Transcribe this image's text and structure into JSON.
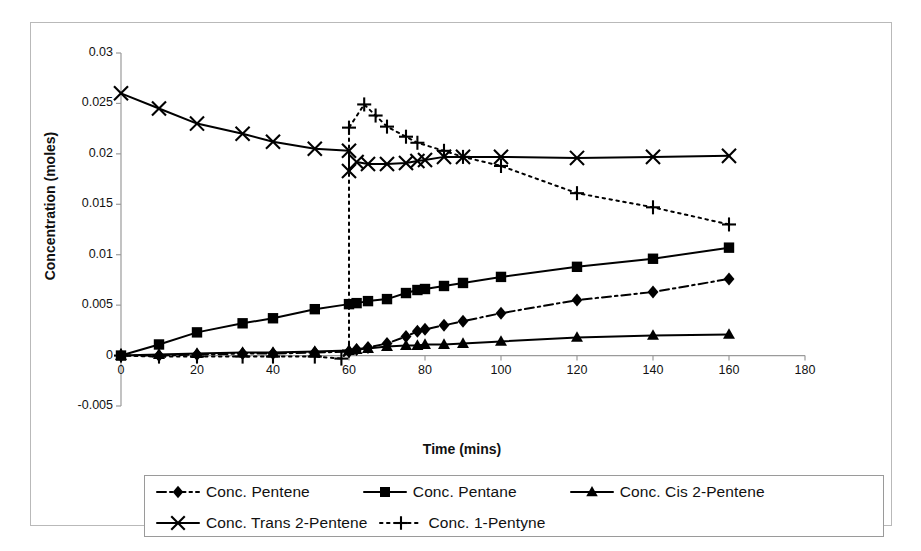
{
  "chart_data": {
    "type": "line",
    "title": "",
    "xlabel": "Time (mins)",
    "ylabel": "Concentration (moles)",
    "xlim": [
      0,
      180
    ],
    "ylim": [
      -0.005,
      0.03
    ],
    "xticks": [
      0,
      20,
      40,
      60,
      80,
      100,
      120,
      140,
      160,
      180
    ],
    "xtick_labels": [
      "0",
      "20",
      "40",
      "60",
      "80",
      "100",
      "120",
      "140",
      "160",
      "180"
    ],
    "yticks": [
      -0.005,
      0,
      0.005,
      0.01,
      0.015,
      0.02,
      0.025,
      0.03
    ],
    "ytick_labels": [
      "-0.005",
      "0",
      "0.005",
      "0.01",
      "0.015",
      "0.02",
      "0.025",
      "0.03"
    ],
    "grid": false,
    "legend_position": "bottom",
    "series": [
      {
        "name": "Conc. Pentene",
        "marker": "diamond",
        "line_style": "dash-dot",
        "color": "#000000",
        "x": [
          0,
          10,
          20,
          32,
          40,
          51,
          60,
          62,
          65,
          70,
          75,
          78,
          80,
          85,
          90,
          100,
          120,
          140,
          160
        ],
        "y": [
          0.0,
          0.0,
          0.0001,
          0.0002,
          0.0002,
          0.0003,
          0.0004,
          0.0006,
          0.0008,
          0.0012,
          0.0019,
          0.0024,
          0.0026,
          0.003,
          0.0034,
          0.0042,
          0.0055,
          0.0063,
          0.0076
        ]
      },
      {
        "name": "Conc. Pentane",
        "marker": "square",
        "line_style": "solid",
        "color": "#000000",
        "x": [
          0,
          10,
          20,
          32,
          40,
          51,
          60,
          62,
          65,
          70,
          75,
          78,
          80,
          85,
          90,
          100,
          120,
          140,
          160
        ],
        "y": [
          0.0,
          0.0011,
          0.0023,
          0.0032,
          0.0037,
          0.0046,
          0.0051,
          0.0052,
          0.0054,
          0.0056,
          0.0062,
          0.0065,
          0.0066,
          0.0069,
          0.0072,
          0.0078,
          0.0088,
          0.0096,
          0.0107
        ]
      },
      {
        "name": "Conc. Cis 2-Pentene",
        "marker": "triangle",
        "line_style": "solid",
        "color": "#000000",
        "x": [
          0,
          10,
          20,
          32,
          40,
          51,
          60,
          62,
          65,
          70,
          75,
          78,
          80,
          85,
          90,
          100,
          120,
          140,
          160
        ],
        "y": [
          0.0,
          0.0001,
          0.0002,
          0.0003,
          0.0003,
          0.0004,
          0.0005,
          0.0006,
          0.0007,
          0.0009,
          0.001,
          0.001,
          0.0011,
          0.0011,
          0.0012,
          0.0014,
          0.0018,
          0.002,
          0.0021
        ]
      },
      {
        "name": "Conc. Trans 2-Pentene",
        "marker": "x",
        "line_style": "solid",
        "color": "#000000",
        "x": [
          0,
          10,
          20,
          32,
          40,
          51,
          60,
          60,
          62,
          65,
          70,
          75,
          78,
          80,
          85,
          90,
          100,
          120,
          140,
          160
        ],
        "y": [
          0.026,
          0.0245,
          0.023,
          0.022,
          0.0212,
          0.0205,
          0.0203,
          0.0183,
          0.0192,
          0.019,
          0.019,
          0.0191,
          0.0193,
          0.0194,
          0.0197,
          0.0197,
          0.0197,
          0.0196,
          0.0197,
          0.0198
        ]
      },
      {
        "name": "Conc. 1-Pentyne",
        "marker": "plus",
        "line_style": "dotted",
        "color": "#000000",
        "x": [
          0,
          10,
          20,
          32,
          40,
          51,
          58,
          60,
          60,
          64,
          67,
          70,
          75,
          78,
          85,
          90,
          100,
          120,
          140,
          160
        ],
        "y": [
          0.0,
          -0.0001,
          -0.0001,
          -0.0001,
          -0.0001,
          -0.0001,
          -0.0003,
          0.0005,
          0.0226,
          0.0249,
          0.0238,
          0.0227,
          0.0217,
          0.0211,
          0.0203,
          0.0197,
          0.0188,
          0.0161,
          0.0147,
          0.013
        ]
      }
    ]
  },
  "legend": {
    "rows": [
      [
        {
          "label": "Conc. Pentene",
          "marker": "diamond",
          "line_style": "dash-dot"
        },
        {
          "label": "Conc. Pentane",
          "marker": "square",
          "line_style": "solid"
        },
        {
          "label": "Conc. Cis 2-Pentene",
          "marker": "triangle",
          "line_style": "solid"
        }
      ],
      [
        {
          "label": "Conc. Trans 2-Pentene",
          "marker": "x",
          "line_style": "solid"
        },
        {
          "label": "Conc. 1-Pentyne",
          "marker": "plus",
          "line_style": "dotted"
        }
      ]
    ]
  },
  "colors": {
    "ink": "#000000",
    "axis": "#9a9a9a",
    "frame": "#b9b9b9"
  }
}
